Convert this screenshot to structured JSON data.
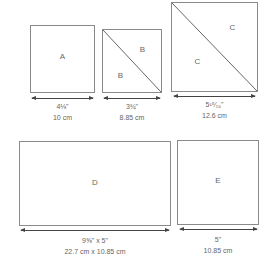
{
  "pieces": [
    {
      "id": "A",
      "labels": [
        "A"
      ],
      "dim_imperial": "4⅛\"",
      "dim_metric": "10 cm"
    },
    {
      "id": "B",
      "labels": [
        "B",
        "B"
      ],
      "dim_imperial": "3¾\"",
      "dim_metric": "8.85 cm"
    },
    {
      "id": "C",
      "labels": [
        "C",
        "C"
      ],
      "dim_imperial": "5¹⁵⁄₁₆\"",
      "dim_metric": "12.6 cm"
    },
    {
      "id": "D",
      "labels": [
        "D"
      ],
      "dim_imperial": "9⅝\" x 5\"",
      "dim_metric": "22.7 cm x 10.85 cm"
    },
    {
      "id": "E",
      "labels": [
        "E"
      ],
      "dim_imperial": "5\"",
      "dim_metric": "10.85 cm"
    }
  ],
  "colors": {
    "outline": "#8a8a8a",
    "text": "#666666",
    "arrow": "#444444"
  }
}
